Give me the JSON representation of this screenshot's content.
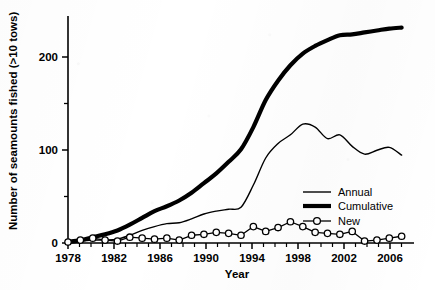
{
  "chart_data": {
    "type": "line",
    "title": "",
    "xlabel": "Year",
    "ylabel": "Number of seamounts fished (>10 tows)",
    "xlim": [
      1978,
      2006
    ],
    "ylim": [
      0,
      235
    ],
    "xticks": [
      1978,
      1982,
      1986,
      1990,
      1994,
      1998,
      2002,
      2006
    ],
    "xticklabels": [
      "1978",
      "1982",
      "1986",
      "1990",
      "1994",
      "1998",
      "2002",
      "2006"
    ],
    "yticks": [
      0,
      100,
      200
    ],
    "yticklabels": [
      "0",
      "100",
      "200"
    ],
    "yminorticks": [
      50,
      150
    ],
    "xminortick_interval": 1,
    "grid": false,
    "legend_position": "center-right",
    "x": [
      1978,
      1979,
      1980,
      1981,
      1982,
      1983,
      1984,
      1985,
      1986,
      1987,
      1988,
      1989,
      1990,
      1991,
      1992,
      1993,
      1994,
      1995,
      1996,
      1997,
      1998,
      1999,
      2000,
      2001,
      2002,
      2003,
      2004,
      2005
    ],
    "series": [
      {
        "name": "Annual",
        "style": "thin-line",
        "values": [
          1,
          2,
          3,
          3,
          4,
          8,
          13,
          17,
          20,
          21,
          25,
          30,
          33,
          35,
          37,
          60,
          88,
          103,
          112,
          123,
          120,
          108,
          112,
          100,
          92,
          96,
          99,
          91
        ]
      },
      {
        "name": "Cumulative",
        "style": "thick-line",
        "values": [
          1,
          3,
          6,
          9,
          13,
          19,
          26,
          33,
          38,
          44,
          52,
          62,
          72,
          84,
          97,
          120,
          148,
          168,
          184,
          196,
          204,
          210,
          215,
          216,
          218,
          220,
          222,
          223
        ]
      },
      {
        "name": "New",
        "style": "line-open-circle-markers",
        "values": [
          1,
          3,
          5,
          3,
          2,
          6,
          5,
          4,
          5,
          3,
          8,
          9,
          11,
          10,
          8,
          17,
          12,
          16,
          22,
          17,
          11,
          10,
          9,
          12,
          2,
          3,
          5,
          7
        ]
      }
    ]
  },
  "legend": {
    "items": [
      {
        "label": "Annual",
        "style": "thin-line"
      },
      {
        "label": "Cumulative",
        "style": "thick-line"
      },
      {
        "label": "New",
        "style": "open-circle-line"
      }
    ]
  }
}
